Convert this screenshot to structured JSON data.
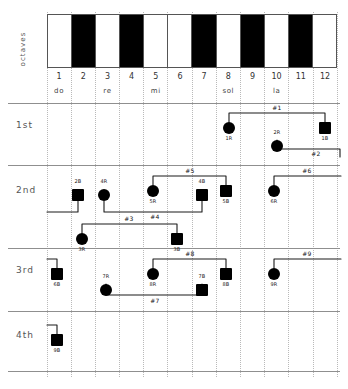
{
  "figure": {
    "octaves_axis_label": "octaves",
    "keyboard": {
      "keys": [
        {
          "n": "1",
          "type": "white"
        },
        {
          "n": "2",
          "type": "black"
        },
        {
          "n": "3",
          "type": "white"
        },
        {
          "n": "4",
          "type": "black"
        },
        {
          "n": "5",
          "type": "white"
        },
        {
          "n": "6",
          "type": "white"
        },
        {
          "n": "7",
          "type": "black"
        },
        {
          "n": "8",
          "type": "white"
        },
        {
          "n": "9",
          "type": "black"
        },
        {
          "n": "10",
          "type": "white"
        },
        {
          "n": "11",
          "type": "black"
        },
        {
          "n": "12",
          "type": "white"
        }
      ],
      "numbers": [
        "1",
        "2",
        "3",
        "4",
        "5",
        "6",
        "7",
        "8",
        "9",
        "10",
        "11",
        "12"
      ],
      "solfege": [
        "do",
        "",
        "re",
        "",
        "mi",
        "",
        "",
        "sol",
        "",
        "la",
        "",
        ""
      ]
    },
    "row_labels": [
      "1st",
      "2nd",
      "3rd",
      "4th"
    ],
    "markers": [
      {
        "id": "m-1r",
        "label": "1R",
        "shape": "circle",
        "row": "1st",
        "semitone": 8,
        "label_pos": "below"
      },
      {
        "id": "m-1b",
        "label": "1B",
        "shape": "square",
        "row": "1st",
        "semitone": 12,
        "label_pos": "below"
      },
      {
        "id": "m-2r",
        "label": "2R",
        "shape": "circle",
        "row": "1st",
        "semitone": 10,
        "label_pos": "above"
      },
      {
        "id": "m-2b",
        "label": "2B",
        "shape": "square",
        "row": "2nd",
        "semitone": 2,
        "label_pos": "above"
      },
      {
        "id": "m-4r",
        "label": "4R",
        "shape": "circle",
        "row": "2nd",
        "semitone": 3,
        "label_pos": "above"
      },
      {
        "id": "m-5r",
        "label": "5R",
        "shape": "circle",
        "row": "2nd",
        "semitone": 5,
        "label_pos": "below"
      },
      {
        "id": "m-4b",
        "label": "4B",
        "shape": "square",
        "row": "2nd",
        "semitone": 7,
        "label_pos": "above"
      },
      {
        "id": "m-5b",
        "label": "5B",
        "shape": "square",
        "row": "2nd",
        "semitone": 8,
        "label_pos": "below"
      },
      {
        "id": "m-6r",
        "label": "6R",
        "shape": "circle",
        "row": "2nd",
        "semitone": 10,
        "label_pos": "below"
      },
      {
        "id": "m-3r",
        "label": "3R",
        "shape": "circle",
        "row": "2nd",
        "semitone": 2,
        "label_pos": "below"
      },
      {
        "id": "m-3b",
        "label": "3B",
        "shape": "square",
        "row": "2nd",
        "semitone": 7,
        "label_pos": "below"
      },
      {
        "id": "m-6b",
        "label": "6B",
        "shape": "square",
        "row": "3rd",
        "semitone": 1,
        "label_pos": "below"
      },
      {
        "id": "m-7r",
        "label": "7R",
        "shape": "circle",
        "row": "3rd",
        "semitone": 3,
        "label_pos": "above"
      },
      {
        "id": "m-8r",
        "label": "8R",
        "shape": "circle",
        "row": "3rd",
        "semitone": 5,
        "label_pos": "below"
      },
      {
        "id": "m-7b",
        "label": "7B",
        "shape": "square",
        "row": "3rd",
        "semitone": 7,
        "label_pos": "above"
      },
      {
        "id": "m-8b",
        "label": "8B",
        "shape": "square",
        "row": "3rd",
        "semitone": 8,
        "label_pos": "below"
      },
      {
        "id": "m-9r",
        "label": "9R",
        "shape": "circle",
        "row": "3rd",
        "semitone": 10,
        "label_pos": "below"
      },
      {
        "id": "m-9b",
        "label": "9B",
        "shape": "square",
        "row": "4th",
        "semitone": 1,
        "label_pos": "below"
      }
    ],
    "group_tags": [
      {
        "id": "g1",
        "label": "#1"
      },
      {
        "id": "g2",
        "label": "#2"
      },
      {
        "id": "g3",
        "label": "#3"
      },
      {
        "id": "g4",
        "label": "#4"
      },
      {
        "id": "g5",
        "label": "#5"
      },
      {
        "id": "g6",
        "label": "#6"
      },
      {
        "id": "g7",
        "label": "#7"
      },
      {
        "id": "g8",
        "label": "#8"
      },
      {
        "id": "g9",
        "label": "#9"
      }
    ]
  }
}
